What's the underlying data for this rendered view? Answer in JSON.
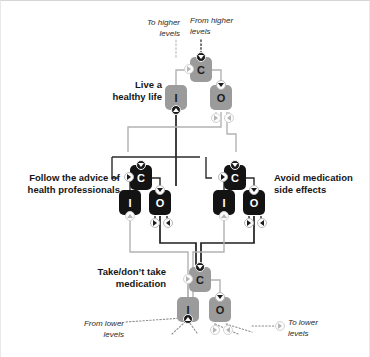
{
  "diagram": {
    "title_present": false,
    "colors": {
      "node_gray": "#9b9b9b",
      "node_black": "#131313",
      "link_gray": "#b3b3b3",
      "link_black": "#1f1f1f",
      "port_dark": "#1a1a1a",
      "port_open": "#fdfdfd",
      "text": "#161616",
      "frame_border": "#d4d4d4"
    },
    "node_glyphs": {
      "comparator": "C",
      "input": "I",
      "output": "O"
    },
    "levels": [
      {
        "id": "higher-level",
        "label": "Live a\nhealthy life",
        "label_align": "right",
        "style": "gray",
        "nodes": [
          {
            "role": "comparator",
            "glyph": "C"
          },
          {
            "role": "input",
            "glyph": "I"
          },
          {
            "role": "output",
            "glyph": "O"
          }
        ]
      },
      {
        "id": "middle-level-left",
        "label": "Follow the advice of\nhealth professionals",
        "label_align": "right",
        "style": "black",
        "nodes": [
          {
            "role": "comparator",
            "glyph": "C"
          },
          {
            "role": "input",
            "glyph": "I"
          },
          {
            "role": "output",
            "glyph": "O"
          }
        ]
      },
      {
        "id": "middle-level-right",
        "label": "Avoid medication\nside effects",
        "label_align": "left",
        "style": "black",
        "nodes": [
          {
            "role": "comparator",
            "glyph": "C"
          },
          {
            "role": "input",
            "glyph": "I"
          },
          {
            "role": "output",
            "glyph": "O"
          }
        ]
      },
      {
        "id": "lower-level",
        "label": "Take/don’t take\nmedication",
        "label_align": "right",
        "style": "gray",
        "nodes": [
          {
            "role": "comparator",
            "glyph": "C"
          },
          {
            "role": "input",
            "glyph": "I"
          },
          {
            "role": "output",
            "glyph": "O"
          }
        ]
      }
    ],
    "external_labels": [
      {
        "id": "to-higher-levels",
        "text": "To higher\nlevels",
        "align": "right"
      },
      {
        "id": "from-higher-levels",
        "text": "From higher\nlevels",
        "align": "left"
      },
      {
        "id": "from-lower-levels",
        "text": "From lower\nlevels",
        "align": "right"
      },
      {
        "id": "to-lower-levels",
        "text": "To  lower\nlevels",
        "align": "left"
      }
    ]
  }
}
